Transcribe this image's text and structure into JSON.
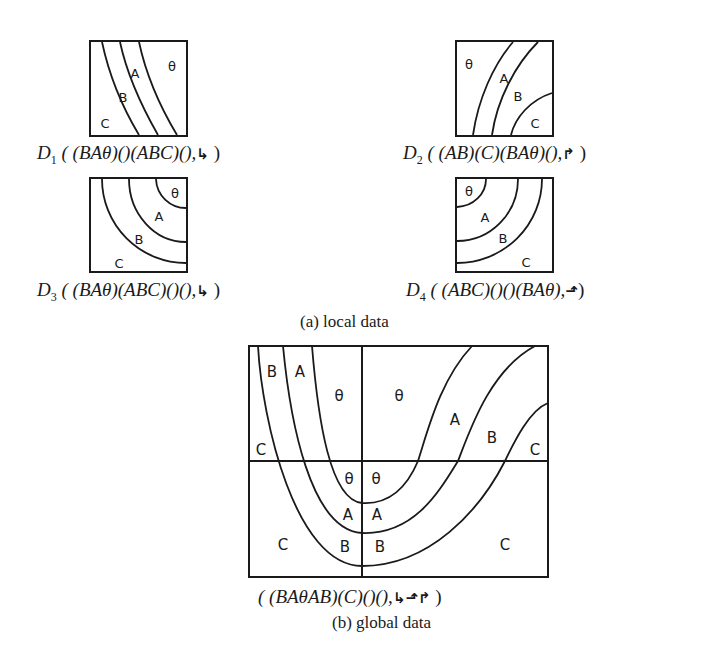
{
  "local": {
    "subcaption": "(a) local data",
    "d1": {
      "name": "D",
      "index": "1",
      "tuple": "( (BAθ)()(ABC)(),",
      "arrows": "↳",
      "close": " )",
      "regions": [
        "θ",
        "A",
        "B",
        "C"
      ]
    },
    "d2": {
      "name": "D",
      "index": "2",
      "tuple": "( (AB)(C)(BAθ)(),",
      "arrows": "↱",
      "close": " )",
      "regions": [
        "θ",
        "A",
        "B",
        "C"
      ]
    },
    "d3": {
      "name": "D",
      "index": "3",
      "tuple": "( (BAθ)(ABC)()(),",
      "arrows": "↳",
      "close": " )",
      "regions": [
        "θ",
        "A",
        "B",
        "C"
      ]
    },
    "d4": {
      "name": "D",
      "index": "4",
      "tuple": "( (ABC)()()(BAθ),",
      "arrows": "⬏",
      "close": ")",
      "regions": [
        "θ",
        "A",
        "B",
        "C"
      ]
    }
  },
  "global": {
    "subcaption": "(b) global data",
    "tuple": "( (BAθAB)(C)()(),",
    "arrows": "↳⬏↱",
    "close": " )",
    "regions": {
      "top_left_B": "B",
      "top_left_A": "A",
      "top_left_theta": "θ",
      "top_right_theta": "θ",
      "top_right_A": "A",
      "top_right_B": "B",
      "top_right_C": "C",
      "top_left_C": "C",
      "bot_left_theta": "θ",
      "bot_right_theta": "θ",
      "bot_left_A": "A",
      "bot_right_A": "A",
      "bot_left_B": "B",
      "bot_right_B": "B",
      "bot_left_C": "C",
      "bot_right_C": "C"
    }
  }
}
